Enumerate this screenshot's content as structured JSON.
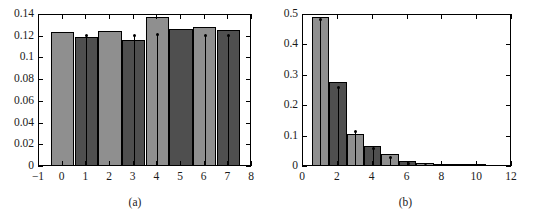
{
  "figure": {
    "background": "#ffffff",
    "panels": [
      {
        "id": "a",
        "caption": "(a)",
        "colors": {
          "light_bar": "#8f8f8f",
          "dark_bar": "#4f4f4f",
          "edge": "#000000",
          "errorbar": "#000000"
        }
      },
      {
        "id": "b",
        "caption": "(b)",
        "colors": {
          "light_bar": "#8f8f8f",
          "dark_bar": "#4f4f4f",
          "edge": "#000000",
          "errorbar": "#000000"
        }
      }
    ]
  },
  "chart_data": [
    {
      "type": "bar",
      "panel": "a",
      "title": "",
      "subtitle": "",
      "xlabel": "",
      "ylabel": "",
      "caption": "(a)",
      "grid": false,
      "legend": null,
      "xlim": [
        -1,
        8
      ],
      "ylim": [
        0,
        0.14
      ],
      "xticks": [
        -1,
        0,
        1,
        2,
        3,
        4,
        5,
        6,
        7,
        8
      ],
      "xticklabels": [
        "−1",
        "0",
        "1",
        "2",
        "3",
        "4",
        "5",
        "6",
        "7",
        "8"
      ],
      "yticks": [
        0,
        0.02,
        0.04,
        0.06,
        0.08,
        0.1,
        0.12,
        0.14
      ],
      "yticklabels": [
        "0",
        "0.02",
        "0.04",
        "0.06",
        "0.08",
        "0.1",
        "0.12",
        "0.14"
      ],
      "bar_width": 1.0,
      "categories": [
        0,
        1,
        2,
        3,
        4,
        5,
        6,
        7
      ],
      "values": [
        0.1225,
        0.1175,
        0.1235,
        0.1155,
        0.1365,
        0.125,
        0.1275,
        0.124
      ],
      "bar_colors": [
        "light",
        "dark",
        "light",
        "dark",
        "light",
        "dark",
        "light",
        "dark"
      ],
      "errorbars": {
        "present": true,
        "style": "vertical-line-with-dot",
        "x": [
          1,
          3,
          4,
          6,
          7
        ],
        "top": [
          0.1215,
          0.1215,
          0.1225,
          0.1215,
          0.1215
        ]
      }
    },
    {
      "type": "bar",
      "panel": "b",
      "title": "",
      "subtitle": "",
      "xlabel": "",
      "ylabel": "",
      "caption": "(b)",
      "grid": false,
      "legend": null,
      "xlim": [
        0,
        12
      ],
      "ylim": [
        0,
        0.5
      ],
      "xticks": [
        0,
        2,
        4,
        6,
        8,
        10,
        12
      ],
      "xticklabels": [
        "0",
        "2",
        "4",
        "6",
        "8",
        "10",
        "12"
      ],
      "yticks": [
        0,
        0.1,
        0.2,
        0.3,
        0.4,
        0.5
      ],
      "yticklabels": [
        "0",
        "0.1",
        "0.2",
        "0.3",
        "0.4",
        "0.5"
      ],
      "bar_width": 1.0,
      "categories": [
        1,
        2,
        3,
        4,
        5,
        6,
        7,
        8,
        9,
        10
      ],
      "values": [
        0.487,
        0.273,
        0.101,
        0.064,
        0.035,
        0.013,
        0.005,
        0.002,
        0.001,
        0.0005
      ],
      "bar_colors": [
        "light",
        "dark",
        "light",
        "dark",
        "light",
        "dark",
        "light",
        "dark",
        "light",
        "dark"
      ],
      "errorbars": {
        "present": true,
        "style": "vertical-line-with-dot",
        "x": [
          1,
          2,
          3,
          4,
          5,
          6,
          7,
          9
        ],
        "top": [
          0.487,
          0.262,
          0.117,
          0.062,
          0.033,
          0.012,
          0.005,
          0.002
        ]
      }
    }
  ]
}
